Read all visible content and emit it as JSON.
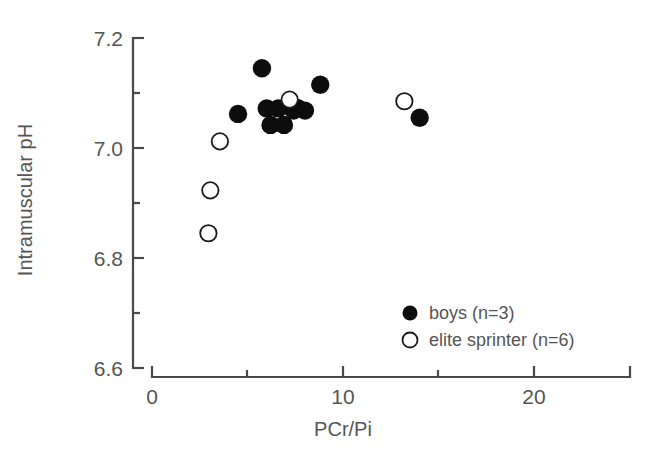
{
  "chart_data": {
    "type": "scatter",
    "title": "",
    "xlabel": "PCr/Pi",
    "ylabel": "Intramuscular pH",
    "xlim": [
      0,
      25
    ],
    "ylim": [
      6.6,
      7.2
    ],
    "grid": false,
    "x_ticks_major": [
      0,
      10,
      20
    ],
    "x_tick_labels": [
      "0",
      "10",
      "20"
    ],
    "x_ticks_minor": [
      5,
      15,
      25
    ],
    "y_ticks_major": [
      7.2,
      7.0,
      6.8,
      6.6
    ],
    "y_tick_labels": [
      "7.2",
      "7.0",
      "6.8",
      "6.6"
    ],
    "y_ticks_minor": [
      7.1,
      6.9,
      6.7
    ],
    "legend_position": "inside-lower-right",
    "series": [
      {
        "name": "boys  (n=3)",
        "marker": "filled-circle",
        "color": "#0d0d0d",
        "points": [
          {
            "x": 4.5,
            "y": 7.062
          },
          {
            "x": 5.75,
            "y": 7.145
          },
          {
            "x": 6.0,
            "y": 7.072
          },
          {
            "x": 6.2,
            "y": 7.042
          },
          {
            "x": 6.6,
            "y": 7.072
          },
          {
            "x": 6.9,
            "y": 7.042
          },
          {
            "x": 7.4,
            "y": 7.068
          },
          {
            "x": 7.6,
            "y": 7.073
          },
          {
            "x": 8.0,
            "y": 7.068
          },
          {
            "x": 8.8,
            "y": 7.115
          },
          {
            "x": 14.0,
            "y": 7.055
          }
        ]
      },
      {
        "name": "elite sprinter  (n=6)",
        "marker": "open-circle",
        "color": "#ffffff",
        "points": [
          {
            "x": 2.95,
            "y": 6.845
          },
          {
            "x": 3.05,
            "y": 6.923
          },
          {
            "x": 3.55,
            "y": 7.012
          },
          {
            "x": 7.2,
            "y": 7.088
          },
          {
            "x": 13.2,
            "y": 7.085
          }
        ]
      }
    ]
  },
  "legend": {
    "items": [
      {
        "label": "boys  (n=3)",
        "marker": "filled-circle"
      },
      {
        "label": "elite sprinter  (n=6)",
        "marker": "open-circle"
      }
    ]
  },
  "axes": {
    "x_title": "PCr/Pi",
    "y_title": "Intramuscular pH"
  }
}
